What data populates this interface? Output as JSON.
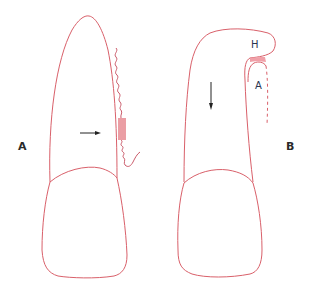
{
  "figure": {
    "panels": [
      {
        "id": "A",
        "label": "A",
        "description": "Tooth with arrow pointing right toward striped attachment zone and wavy fibers"
      },
      {
        "id": "B",
        "label": "B",
        "description": "Tooth with curled root tip, downward arrow, labels H and A",
        "annotations": {
          "upper": "H",
          "lower": "A"
        }
      }
    ],
    "colors": {
      "outline": "#d9606a",
      "fill_patch": "#f0a0a8",
      "arrow": "#222222",
      "label": "#2a2a2a"
    }
  }
}
